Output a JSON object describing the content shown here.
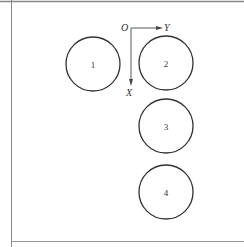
{
  "diagram": {
    "frame": {
      "stroke": "#888888",
      "top_y": 1.5,
      "left_x": 11.5,
      "bottom_y": 241.5
    },
    "axes": {
      "origin_label": "O",
      "x_axis_label": "X",
      "y_axis_label": "Y",
      "origin": [
        131,
        28
      ],
      "y_axis_end": [
        163,
        28
      ],
      "x_axis_end": [
        131,
        86
      ],
      "stroke": "#444444"
    },
    "circles": [
      {
        "id": "1",
        "label": "1",
        "cx": 93,
        "cy": 64,
        "r": 27
      },
      {
        "id": "2",
        "label": "2",
        "cx": 166,
        "cy": 63,
        "r": 27
      },
      {
        "id": "3",
        "label": "3",
        "cx": 166,
        "cy": 126,
        "r": 27
      },
      {
        "id": "4",
        "label": "4",
        "cx": 166,
        "cy": 192,
        "r": 27
      }
    ],
    "circle_stroke": "#333333"
  }
}
